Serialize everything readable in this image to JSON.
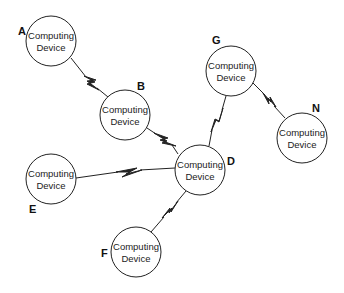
{
  "diagram": {
    "type": "network-topology",
    "node_text_line1": "Computing",
    "node_text_line2": "Device",
    "nodes": [
      {
        "id": "A",
        "label": "A",
        "line1": "Computing",
        "line2": "Device",
        "cx": 51,
        "cy": 41,
        "r": 25,
        "lx": 18,
        "ly": 35
      },
      {
        "id": "B",
        "label": "B",
        "line1": "Computing",
        "line2": "Device",
        "cx": 125,
        "cy": 115,
        "r": 25,
        "lx": 137,
        "ly": 90
      },
      {
        "id": "G",
        "label": "G",
        "line1": "Computing",
        "line2": "Device",
        "cx": 231,
        "cy": 71,
        "r": 25,
        "lx": 212,
        "ly": 44
      },
      {
        "id": "N",
        "label": "N",
        "line1": "Computing",
        "line2": "Device",
        "cx": 302,
        "cy": 138,
        "r": 25,
        "lx": 312,
        "ly": 112
      },
      {
        "id": "D",
        "label": "D",
        "line1": "Computing",
        "line2": "Device",
        "cx": 200,
        "cy": 170,
        "r": 25,
        "lx": 227,
        "ly": 165
      },
      {
        "id": "E",
        "label": "E",
        "line1": "Computing",
        "line2": "Device",
        "cx": 51,
        "cy": 179,
        "r": 25,
        "lx": 29,
        "ly": 213
      },
      {
        "id": "F",
        "label": "F",
        "line1": "Computing",
        "line2": "Device",
        "cx": 136,
        "cy": 252,
        "r": 25,
        "lx": 101,
        "ly": 257
      }
    ],
    "links": [
      {
        "from": "A",
        "to": "B",
        "type": "wireless"
      },
      {
        "from": "B",
        "to": "D",
        "type": "wireless"
      },
      {
        "from": "G",
        "to": "D",
        "type": "wireless"
      },
      {
        "from": "G",
        "to": "N",
        "type": "wireless"
      },
      {
        "from": "E",
        "to": "D",
        "type": "wireless"
      },
      {
        "from": "F",
        "to": "D",
        "type": "wireless"
      }
    ],
    "colors": {
      "stroke": "#222222",
      "background": "#ffffff"
    }
  }
}
